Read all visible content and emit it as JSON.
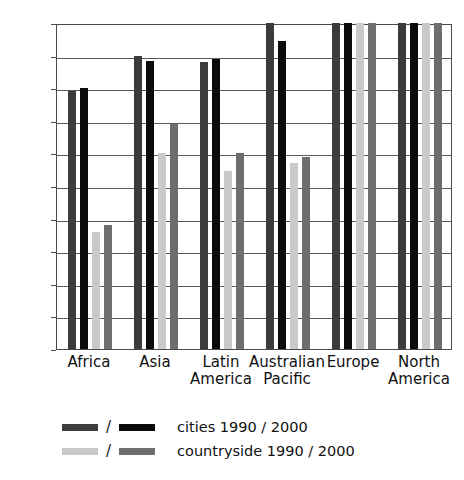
{
  "chart_data": {
    "type": "bar",
    "title": "",
    "xlabel": "",
    "ylabel": "connected inhabitants (%)",
    "ylim": [
      0,
      100
    ],
    "ytick_step": 10,
    "grid": true,
    "legend_position": "below",
    "categories": [
      "Africa",
      "Asia",
      "Latin America",
      "Australian Pacific",
      "Europe",
      "North America"
    ],
    "category_lines": [
      [
        "Africa",
        ""
      ],
      [
        "Asia",
        ""
      ],
      [
        "Latin",
        "America"
      ],
      [
        "Australian",
        "Pacific"
      ],
      [
        "Europe",
        ""
      ],
      [
        "North",
        "America"
      ]
    ],
    "ytick_labels": [
      "0",
      "10",
      "20",
      "30",
      "40",
      "50",
      "60",
      "70",
      "80",
      "90",
      "100"
    ],
    "series": [
      {
        "name": "cities 1990",
        "color": "#3c3c3c",
        "values": [
          79,
          90,
          88,
          100,
          100,
          100
        ]
      },
      {
        "name": "cities 2000",
        "color": "#0b0b0b",
        "values": [
          80,
          88.5,
          89,
          94.5,
          100,
          100
        ]
      },
      {
        "name": "countryside 1990",
        "color": "#c9c9c9",
        "values": [
          36,
          60,
          54.5,
          57,
          100,
          100
        ]
      },
      {
        "name": "countryside 2000",
        "color": "#6e6e6e",
        "values": [
          38,
          69,
          60,
          59,
          100,
          100
        ]
      }
    ]
  },
  "legend": {
    "rows": [
      {
        "swatch_a": "cities-1990-swatch",
        "swatch_b": "cities-2000-swatch",
        "separator": "/",
        "label": "cities 1990 / 2000"
      },
      {
        "swatch_a": "countryside-1990-swatch",
        "swatch_b": "countryside-2000-swatch",
        "separator": "/",
        "label": "countryside 1990 / 2000"
      }
    ]
  }
}
